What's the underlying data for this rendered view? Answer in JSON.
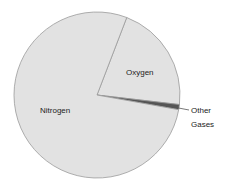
{
  "chart_data": {
    "type": "pie",
    "title": "",
    "categories": [
      "Nitrogen",
      "Oxygen",
      "Other Gases"
    ],
    "values": [
      78,
      21,
      1
    ],
    "unit": "%",
    "colors": {
      "Nitrogen": "#e2e2e2",
      "Oxygen": "#e2e2e2",
      "Other Gases": "#555555",
      "border": "#9a9a9a"
    },
    "labels": {
      "nitrogen": "Nitrogen",
      "oxygen": "Oxygen",
      "other_line1": "Other",
      "other_line2": "Gases"
    },
    "layout": {
      "center": [
        97,
        95
      ],
      "radius": 83,
      "start_angle_deg": -69,
      "legend": "none",
      "other_label_with_leader_line": true
    }
  }
}
